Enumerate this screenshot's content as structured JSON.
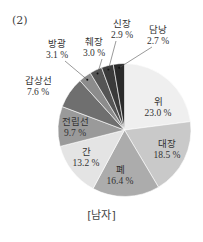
{
  "chart_data": {
    "type": "pie",
    "panel_label": "(2)",
    "title": "",
    "caption": "[남자]",
    "start_angle": "12 o'clock",
    "direction": "clockwise",
    "slices": [
      {
        "label": "위",
        "value": 23.0,
        "pct_text": "23.0 %",
        "color": "#efefef"
      },
      {
        "label": "대장",
        "value": 18.5,
        "pct_text": "18.5 %",
        "color": "#c9c9c9"
      },
      {
        "label": "폐",
        "value": 16.4,
        "pct_text": "16.4 %",
        "color": "#acacac"
      },
      {
        "label": "간",
        "value": 13.2,
        "pct_text": "13.2 %",
        "color": "#e4e4e4"
      },
      {
        "label": "전립선",
        "value": 9.7,
        "pct_text": "9.7 %",
        "color": "#9a9a9a"
      },
      {
        "label": "갑상선",
        "value": 7.6,
        "pct_text": "7.6 %",
        "color": "#6f6f6f"
      },
      {
        "label": "방광",
        "value": 3.1,
        "pct_text": "3.1 %",
        "color": "#8c8c8c"
      },
      {
        "label": "췌장",
        "value": 3.0,
        "pct_text": "3.0 %",
        "color": "#555555"
      },
      {
        "label": "신장",
        "value": 2.9,
        "pct_text": "2.9 %",
        "color": "#3a3a3a"
      },
      {
        "label": "담낭",
        "value": 2.7,
        "pct_text": "2.7 %",
        "color": "#2a2a2a"
      }
    ]
  }
}
